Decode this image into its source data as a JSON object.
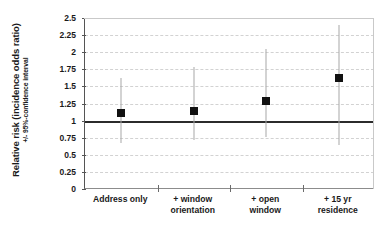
{
  "chart_data": {
    "type": "scatter",
    "title": "",
    "xlabel": "",
    "ylabel": "Relative risk (incidence odds ratio)",
    "ylabel_sub": "+/- 95%-confidence interval",
    "ylim": [
      0,
      2.5
    ],
    "ytick_labels": [
      "2.5",
      "2.25",
      "2",
      "1.75",
      "1.5",
      "1.25",
      "1",
      "0.75",
      "0.5",
      "0.25",
      "0"
    ],
    "ytick_values": [
      2.5,
      2.25,
      2,
      1.75,
      1.5,
      1.25,
      1,
      0.75,
      0.5,
      0.25,
      0
    ],
    "grid": true,
    "grid_axis": "y",
    "legend": "none",
    "reference_line": 1,
    "categories": [
      "Address only",
      "+ window orientation",
      "+ open window",
      "+ 15 yr residence"
    ],
    "category_lines": [
      [
        "Address only"
      ],
      [
        "+ window",
        "orientation"
      ],
      [
        "+ open",
        "window"
      ],
      [
        "+ 15 yr",
        "residence"
      ]
    ],
    "values": [
      1.11,
      1.14,
      1.29,
      1.62
    ],
    "ci_lower": [
      0.67,
      0.72,
      0.76,
      0.64
    ],
    "ci_upper": [
      1.62,
      1.78,
      2.05,
      2.4
    ],
    "marker_color": "#111111",
    "errorbar_color": "#a8a8a8",
    "reference_line_color": "#2b2b2b",
    "gridline_color": "#d2d2d2",
    "axis_color": "#555555",
    "background_color": "#ffffff"
  }
}
